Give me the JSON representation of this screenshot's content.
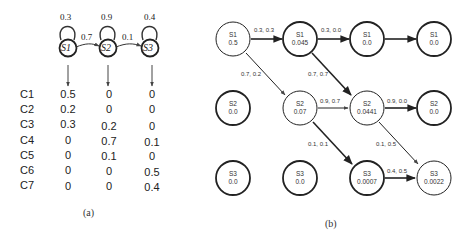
{
  "diagram_a": {
    "caption": "(a)",
    "states": [
      {
        "id": "S1",
        "label": "S1",
        "self_loop": "0.3"
      },
      {
        "id": "S2",
        "label": "S2",
        "self_loop": "0.9"
      },
      {
        "id": "S3",
        "label": "S3",
        "self_loop": "0.4"
      }
    ],
    "transitions": [
      {
        "from": "S1",
        "to": "S2",
        "label": "0.7"
      },
      {
        "from": "S2",
        "to": "S3",
        "label": "0.1"
      }
    ],
    "emission_table": {
      "rows": [
        {
          "label": "C1",
          "values": [
            "0.5",
            "0",
            "0"
          ]
        },
        {
          "label": "C2",
          "values": [
            "0.2",
            "0",
            "0"
          ]
        },
        {
          "label": "C3",
          "values": [
            "0.3",
            "0.2",
            "0"
          ]
        },
        {
          "label": "C4",
          "values": [
            "0",
            "0.7",
            "0.1"
          ]
        },
        {
          "label": "C5",
          "values": [
            "0",
            "0.1",
            "0"
          ]
        },
        {
          "label": "C6",
          "values": [
            "0",
            "0",
            "0.5"
          ]
        },
        {
          "label": "C7",
          "values": [
            "0",
            "0",
            "0.4"
          ]
        }
      ]
    }
  },
  "diagram_b": {
    "caption": "(b)",
    "nodes": [
      {
        "id": "c0s1",
        "state": "S1",
        "value": "0.5"
      },
      {
        "id": "c1s1",
        "state": "S1",
        "value": "0.045"
      },
      {
        "id": "c2s1",
        "state": "S1",
        "value": "0.0"
      },
      {
        "id": "c3s1",
        "state": "S1",
        "value": "0.0"
      },
      {
        "id": "c0s2",
        "state": "S2",
        "value": "0.0"
      },
      {
        "id": "c1s2",
        "state": "S2",
        "value": "0.07"
      },
      {
        "id": "c2s2",
        "state": "S2",
        "value": "0.0441"
      },
      {
        "id": "c3s2",
        "state": "S2",
        "value": "0.0"
      },
      {
        "id": "c0s3",
        "state": "S3",
        "value": "0.0"
      },
      {
        "id": "c1s3",
        "state": "S3",
        "value": "0.0"
      },
      {
        "id": "c2s3",
        "state": "S3",
        "value": "0.0007"
      },
      {
        "id": "c3s3",
        "state": "S3",
        "value": "0.0022"
      }
    ],
    "edges": [
      {
        "from": "c0s1",
        "to": "c1s1",
        "label": "0.3, 0.3"
      },
      {
        "from": "c1s1",
        "to": "c2s1",
        "label": "0.3, 0.0"
      },
      {
        "from": "c2s1",
        "to": "c3s1",
        "label": ""
      },
      {
        "from": "c0s1",
        "to": "c1s2",
        "label": "0.7, 0.2"
      },
      {
        "from": "c1s1",
        "to": "c2s2",
        "label": "0.7, 0.7"
      },
      {
        "from": "c1s2",
        "to": "c2s2",
        "label": "0.9, 0.7"
      },
      {
        "from": "c2s2",
        "to": "c3s2",
        "label": "0.9, 0.0"
      },
      {
        "from": "c1s2",
        "to": "c2s3",
        "label": "0.1, 0.1"
      },
      {
        "from": "c2s2",
        "to": "c3s3",
        "label": "0.1, 0.5"
      },
      {
        "from": "c2s3",
        "to": "c3s3",
        "label": "0.4, 0.5"
      }
    ]
  }
}
